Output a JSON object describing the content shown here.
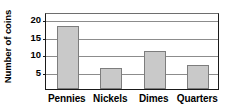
{
  "chart_data": {
    "type": "bar",
    "title": "",
    "xlabel": "",
    "ylabel": "Number of coins",
    "categories": [
      "Pennies",
      "Nickels",
      "Dimes",
      "Quarters"
    ],
    "values": [
      18,
      6,
      11,
      7
    ],
    "ylim": [
      0,
      22
    ],
    "yticks": [
      5,
      10,
      15,
      20
    ],
    "ytick_labels": [
      "5",
      "10",
      "15",
      "20"
    ],
    "grid": true,
    "legend": null,
    "colors": {
      "bar_fill": "#c9c9c9",
      "bar_stroke": "#7d7d7d",
      "axis": "#1a1a1a",
      "gridline": "#8c8c8c",
      "text": "#000000",
      "background": "#ffffff"
    }
  }
}
